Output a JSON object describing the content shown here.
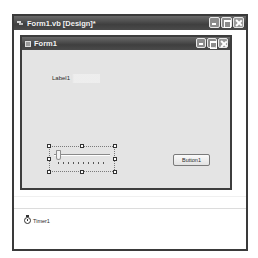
{
  "designer": {
    "title": "Form1.vb [Design]*",
    "icon": "vb-designer-icon"
  },
  "form": {
    "title": "Form1",
    "icon": "form-icon",
    "controls": {
      "label": {
        "text": "Label1"
      },
      "trackbar": {
        "name": "TrackBar",
        "selected": true,
        "value": 0,
        "tick_count": 10
      },
      "button": {
        "text": "Button1"
      }
    }
  },
  "component_tray": {
    "items": [
      {
        "name": "Timer1",
        "icon": "timer-icon"
      }
    ]
  },
  "caption_buttons": [
    "minimize",
    "maximize",
    "close"
  ]
}
